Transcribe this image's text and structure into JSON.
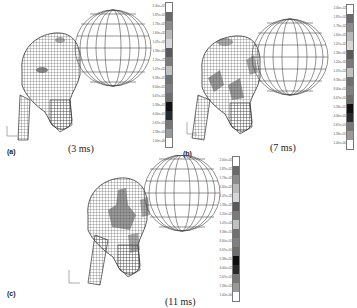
{
  "figure": {
    "panels": [
      {
        "id": "a",
        "label": "(a)",
        "caption": "(3 ms)"
      },
      {
        "id": "b",
        "label": "(b)",
        "caption": "(7 ms)"
      },
      {
        "id": "c",
        "label": "(c)",
        "caption": "(11 ms)"
      }
    ],
    "legend": {
      "levels": [
        "2.00e+02",
        "1.87e+02",
        "1.73e+02",
        "1.60e+02",
        "1.47e+02",
        "1.33e+02",
        "1.20e+02",
        "1.07e+02",
        "9.33e+01",
        "8.00e+01",
        "6.67e+01",
        "5.33e+01",
        "4.00e+01",
        "2.67e+01",
        "1.33e+01",
        "1.00e+00"
      ],
      "colors": [
        "#ffffff",
        "#6a6a6a",
        "#8c8c8c",
        "#b8b8b8",
        "#d6d6d6",
        "#5a5a5a",
        "#7a7a7a",
        "#c0c0c0",
        "#707070",
        "#808080",
        "#6e6e6e",
        "#101010",
        "#2a2a2a",
        "#777777",
        "#999999",
        "#ffffff"
      ]
    },
    "colors": {
      "mesh": "#3a3a3a",
      "sphere": "#4a4a4a",
      "stress_region": "#555555"
    }
  }
}
